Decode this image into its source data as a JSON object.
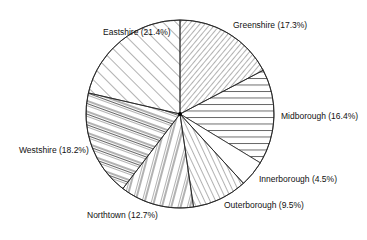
{
  "chart_data": {
    "type": "pie",
    "title": "",
    "start_angle": "top (12 o'clock), clockwise",
    "fill_style": "hatched, black lines on white",
    "slices": [
      {
        "label": "Greenshire",
        "value": 17.3,
        "text": "Greenshire (17.3%)",
        "hatch": "diag-right-dense"
      },
      {
        "label": "Midborough",
        "value": 16.4,
        "text": "Midborough (16.4%)",
        "hatch": "horizontal"
      },
      {
        "label": "Innerborough",
        "value": 4.5,
        "text": "Innerborough (4.5%)",
        "hatch": "none"
      },
      {
        "label": "Outerborough",
        "value": 9.5,
        "text": "Outerborough (9.5%)",
        "hatch": "diag-left-lines"
      },
      {
        "label": "Northtown",
        "value": 12.7,
        "text": "Northtown (12.7%)",
        "hatch": "near-vertical"
      },
      {
        "label": "Westshire",
        "value": 18.2,
        "text": "Westshire (18.2%)",
        "hatch": "shallow-diag-grouped"
      },
      {
        "label": "Eastshire",
        "value": 21.4,
        "text": "Eastshire (21.4%)",
        "hatch": "diag-left-wide"
      }
    ]
  },
  "labels": {
    "greenshire": "Greenshire (17.3%)",
    "midborough": "Midborough (16.4%)",
    "innerborough": "Innerborough (4.5%)",
    "outerborough": "Outerborough (9.5%)",
    "northtown": "Northtown (12.7%)",
    "westshire": "Westshire (18.2%)",
    "eastshire": "Eastshire (21.4%)"
  }
}
